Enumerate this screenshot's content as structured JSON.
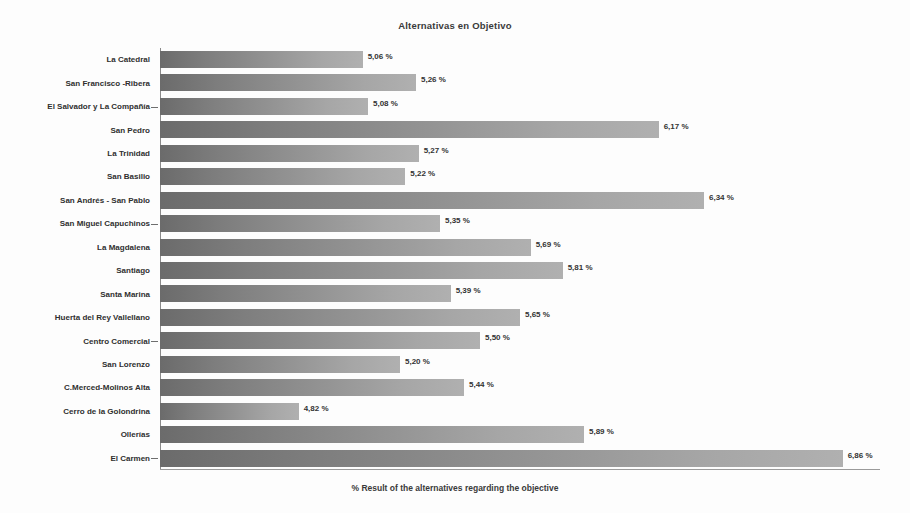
{
  "chart_data": {
    "type": "bar",
    "orientation": "horizontal",
    "title": "Alternativas en Objetivo",
    "xlabel": "% Result of the alternatives regarding the objective",
    "ylabel": "",
    "grid": false,
    "legend": null,
    "xlim": [
      4.3,
      7.0
    ],
    "value_suffix": " %",
    "decimal_separator": ",",
    "categories": [
      "La Catedral",
      "San Francisco -Ribera",
      "El Salvador y La Compañía",
      "San Pedro",
      "La Trinidad",
      "San Basilio",
      "San Andrés - San Pablo",
      "San Miguel Capuchinos",
      "La Magdalena",
      "Santiago",
      "Santa Marina",
      "Huerta del Rey Vallellano",
      "Centro Comercial",
      "San Lorenzo",
      "C.Merced-Molinos Alta",
      "Cerro de la Golondrina",
      "Ollerías",
      "El Carmen"
    ],
    "values": [
      5.06,
      5.26,
      5.08,
      6.17,
      5.27,
      5.22,
      6.34,
      5.35,
      5.69,
      5.81,
      5.39,
      5.65,
      5.5,
      5.2,
      5.44,
      4.82,
      5.89,
      6.86
    ],
    "value_labels": [
      "5,06 %",
      "5,26 %",
      "5,08 %",
      "6,17 %",
      "5,27 %",
      "5,22 %",
      "6,34 %",
      "5,35 %",
      "5,69 %",
      "5,81 %",
      "5,39 %",
      "5,65 %",
      "5,50 %",
      "5,20 %",
      "5,44 %",
      "4,82 %",
      "5,89 %",
      "6,86 %"
    ],
    "bar_color_start": "#6b6b6b",
    "bar_color_end": "#b0b0b0",
    "background_color": "#fdfdfd",
    "axis_color": "#8a8a8a"
  }
}
